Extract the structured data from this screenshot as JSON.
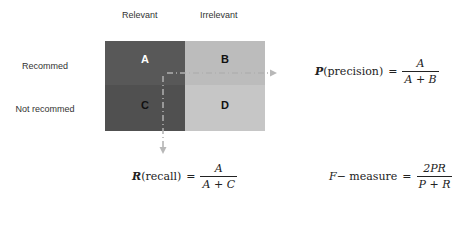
{
  "columns": [
    {
      "label": "Relevant"
    },
    {
      "label": "Irrelevant"
    }
  ],
  "rows": [
    {
      "label": "Recommed"
    },
    {
      "label": "Not recommed"
    }
  ],
  "cells": {
    "a": "A",
    "b": "B",
    "c": "C",
    "d": "D"
  },
  "colors": {
    "relevant_recommended": "#585858",
    "relevant_not_recommended": "#505050",
    "irrelevant_recommended": "#bcbcbc",
    "irrelevant_not_recommended": "#c6c6c6",
    "dashed_arrow": "#b8b8b8"
  },
  "formulas": {
    "precision": {
      "symbol": "P",
      "name": "(precision)",
      "equals": "=",
      "numerator": "A",
      "denominator": "A + B"
    },
    "recall": {
      "symbol": "R",
      "name": "(recall)",
      "equals": "=",
      "numerator": "A",
      "denominator": "A + C"
    },
    "f_measure": {
      "symbol": "F",
      "name": " − measure",
      "equals": "=",
      "numerator": "2PR",
      "denominator": "P + R"
    }
  }
}
